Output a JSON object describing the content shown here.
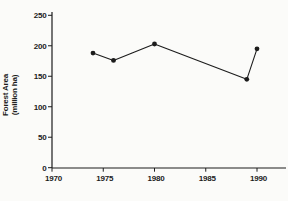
{
  "page": {
    "background": "#fbfbf9",
    "ink": "#1c1c1c"
  },
  "chart_data": {
    "type": "line",
    "title": "",
    "xlabel": "",
    "ylabel": "Forest Area (million ha)",
    "ylabel_lines": [
      "Forest Area",
      "(million ha)"
    ],
    "series": [
      {
        "name": "Forest Area",
        "x": [
          1974,
          1976,
          1980,
          1989,
          1990
        ],
        "values": [
          188,
          176,
          203,
          145,
          195
        ]
      }
    ],
    "x_ticks": [
      1970,
      1975,
      1980,
      1985,
      1990
    ],
    "y_ticks": [
      0,
      50,
      100,
      150,
      200,
      250
    ],
    "xlim": [
      1970,
      1993
    ],
    "ylim": [
      0,
      250
    ],
    "grid": false,
    "legend": false,
    "marker": "circle",
    "marker_radius": 2.4,
    "line_color": "#1c1c1c",
    "marker_color": "#1c1c1c"
  }
}
